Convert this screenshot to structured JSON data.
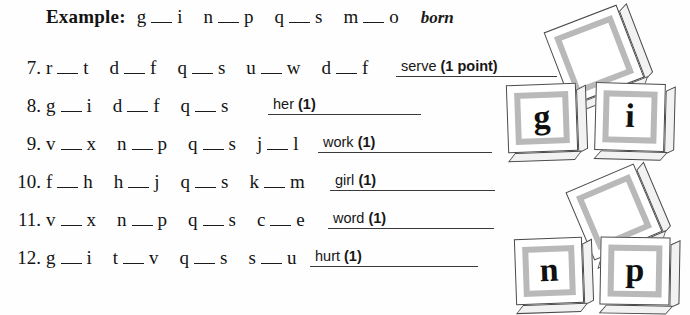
{
  "example": {
    "label": "Example:",
    "pairs": [
      {
        "left": "g",
        "right": "i"
      },
      {
        "left": "n",
        "right": "p"
      },
      {
        "left": "q",
        "right": "s"
      },
      {
        "left": "m",
        "right": "o"
      }
    ],
    "answer": "born"
  },
  "problems": [
    {
      "number": "7.",
      "pairs": [
        {
          "left": "r",
          "right": "t"
        },
        {
          "left": "d",
          "right": "f"
        },
        {
          "left": "q",
          "right": "s"
        },
        {
          "left": "u",
          "right": "w"
        },
        {
          "left": "d",
          "right": "f"
        }
      ],
      "answer_word": "serve",
      "answer_points": "(1 point)"
    },
    {
      "number": "8.",
      "pairs": [
        {
          "left": "g",
          "right": "i"
        },
        {
          "left": "d",
          "right": "f"
        },
        {
          "left": "q",
          "right": "s"
        }
      ],
      "answer_word": "her",
      "answer_points": "(1)"
    },
    {
      "number": "9.",
      "pairs": [
        {
          "left": "v",
          "right": "x"
        },
        {
          "left": "n",
          "right": "p"
        },
        {
          "left": "q",
          "right": "s"
        },
        {
          "left": "j",
          "right": "l"
        }
      ],
      "answer_word": "work",
      "answer_points": "(1)"
    },
    {
      "number": "10.",
      "pairs": [
        {
          "left": "f",
          "right": "h"
        },
        {
          "left": "h",
          "right": "j"
        },
        {
          "left": "q",
          "right": "s"
        },
        {
          "left": "k",
          "right": "m"
        }
      ],
      "answer_word": "girl",
      "answer_points": "(1)"
    },
    {
      "number": "11.",
      "pairs": [
        {
          "left": "v",
          "right": "x"
        },
        {
          "left": "n",
          "right": "p"
        },
        {
          "left": "q",
          "right": "s"
        },
        {
          "left": "c",
          "right": "e"
        }
      ],
      "answer_word": "word",
      "answer_points": "(1)"
    },
    {
      "number": "12.",
      "pairs": [
        {
          "left": "g",
          "right": "i"
        },
        {
          "left": "t",
          "right": "v"
        },
        {
          "left": "q",
          "right": "s"
        },
        {
          "left": "s",
          "right": "u"
        }
      ],
      "answer_word": "hurt",
      "answer_points": "(1)"
    }
  ],
  "blocks": {
    "top_group": [
      {
        "glyph": "",
        "name": "blank-block-top"
      },
      {
        "glyph": "g",
        "name": "letter-block-g"
      },
      {
        "glyph": "i",
        "name": "letter-block-i"
      }
    ],
    "bottom_group": [
      {
        "glyph": "",
        "name": "blank-block-bottom"
      },
      {
        "glyph": "n",
        "name": "letter-block-n"
      },
      {
        "glyph": "p",
        "name": "letter-block-p"
      }
    ]
  },
  "colors": {
    "ink": "#131313",
    "rule": "#3a3a3a",
    "block_frame": "#b9b9b9",
    "paper": "#fefefe"
  }
}
